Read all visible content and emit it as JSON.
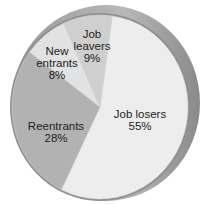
{
  "chart_data": {
    "type": "pie",
    "title": "",
    "categories": [
      "Job losers",
      "Reentrants",
      "New entrants",
      "Job leavers"
    ],
    "values": [
      55,
      28,
      8,
      9
    ],
    "labels": [
      "Job losers 55%",
      "Reentrants 28%",
      "New entrants 8%",
      "Job leavers 9%"
    ],
    "colors": [
      "#ededed",
      "#b2b2b2",
      "#e2e2e2",
      "#cfcfcf"
    ],
    "style": "3d-disc",
    "legend": "none"
  },
  "labels": {
    "job_losers": {
      "name": "Job losers",
      "pct": "55%"
    },
    "reentrants": {
      "name": "Reentrants",
      "pct": "28%"
    },
    "new_entrants": {
      "name1": "New",
      "name2": "entrants",
      "pct": "8%"
    },
    "job_leavers": {
      "name1": "Job",
      "name2": "leavers",
      "pct": "9%"
    }
  }
}
